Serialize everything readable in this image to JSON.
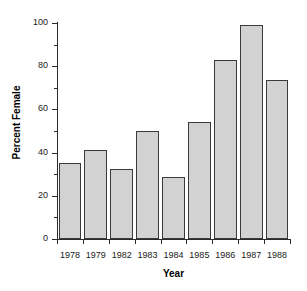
{
  "chart_data": {
    "type": "bar",
    "title": "",
    "xlabel": "Year",
    "ylabel": "Percent Female",
    "categories": [
      "1978",
      "1979",
      "1982",
      "1983",
      "1984",
      "1985",
      "1986",
      "1987",
      "1988"
    ],
    "values": [
      35,
      41,
      32.5,
      50,
      28.5,
      54,
      83,
      99,
      73.5
    ],
    "ylim": [
      0,
      100
    ],
    "y_ticks": [
      0,
      20,
      40,
      60,
      80,
      100
    ],
    "y_tick_labels": [
      "0",
      "20",
      "40",
      "60",
      "80",
      "100"
    ],
    "y_minor_ticks": [
      10,
      30,
      50,
      70,
      90
    ],
    "grid": false,
    "legend": null,
    "bar_fill_color": "#d2d2d2",
    "bar_edge_color": "#3a3a3a",
    "axis_color": "#2b2b2b",
    "background_color": "#ffffff"
  }
}
